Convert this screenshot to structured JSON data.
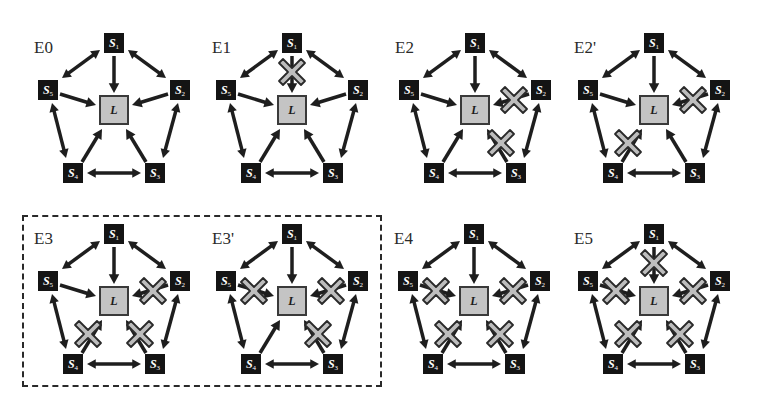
{
  "figure": {
    "colors": {
      "node_fill": "#141414",
      "leader_fill": "#c4c4c4",
      "arrow": "#1e1e1e",
      "cross_fill": "#bdbdbd",
      "cross_stroke": "#2a2a2a"
    },
    "node_labels": {
      "leader": "L",
      "s1": "S",
      "s1_sub": "1",
      "s2": "S",
      "s2_sub": "2",
      "s3": "S",
      "s3_sub": "3",
      "s4": "S",
      "s4_sub": "4",
      "s5": "S",
      "s5_sub": "5"
    },
    "panels": [
      {
        "id": "E0",
        "label": "E0",
        "x": 0,
        "y": 0,
        "failed_links": []
      },
      {
        "id": "E1",
        "label": "E1",
        "x": 178,
        "y": 0,
        "failed_links": [
          "S1-L"
        ]
      },
      {
        "id": "E2",
        "label": "E2",
        "x": 361,
        "y": 0,
        "failed_links": [
          "S2-L",
          "S3-L"
        ]
      },
      {
        "id": "E2p",
        "label": "E2'",
        "x": 540,
        "y": 0,
        "failed_links": [
          "S2-L",
          "S4-L"
        ]
      },
      {
        "id": "E3",
        "label": "E3",
        "x": 0,
        "y": 191,
        "failed_links": [
          "S2-L",
          "S3-L",
          "S4-L"
        ]
      },
      {
        "id": "E3p",
        "label": "E3'",
        "x": 178,
        "y": 191,
        "failed_links": [
          "S5-L",
          "S2-L",
          "S3-L"
        ]
      },
      {
        "id": "E4",
        "label": "E4",
        "x": 360,
        "y": 191,
        "failed_links": [
          "S5-L",
          "S2-L",
          "S3-L",
          "S4-L"
        ]
      },
      {
        "id": "E5",
        "label": "E5",
        "x": 540,
        "y": 191,
        "failed_links": [
          "S1-L",
          "S2-L",
          "S3-L",
          "S4-L",
          "S5-L"
        ]
      }
    ],
    "group_box": {
      "panels": [
        "E3",
        "E3'"
      ],
      "style": "dashed"
    }
  }
}
